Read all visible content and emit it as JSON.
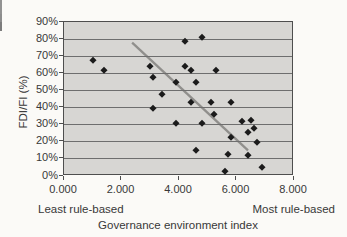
{
  "chart_data": {
    "type": "scatter",
    "title": "",
    "xlabel": "Governance environment index",
    "ylabel": "FDI/FI (%)",
    "x_axis": {
      "min": 0,
      "max": 8,
      "tick_labels": [
        "0.000",
        "2.000",
        "4.000",
        "6.000",
        "8.000"
      ],
      "grid": false
    },
    "y_axis": {
      "min": 0,
      "max": 90,
      "tick_labels": [
        "90%",
        "80%",
        "70%",
        "60%",
        "50%",
        "40%",
        "30%",
        "20%",
        "10%",
        "0%"
      ],
      "grid": true
    },
    "annotations": {
      "left": "Least rule-based",
      "right": "Most rule-based"
    },
    "legend": "none",
    "points": [
      [
        1.0,
        68
      ],
      [
        1.4,
        62
      ],
      [
        3.0,
        64
      ],
      [
        3.1,
        58
      ],
      [
        3.1,
        40
      ],
      [
        3.4,
        48
      ],
      [
        3.9,
        55
      ],
      [
        3.9,
        31
      ],
      [
        4.2,
        79
      ],
      [
        4.2,
        64
      ],
      [
        4.4,
        62
      ],
      [
        4.4,
        43
      ],
      [
        4.6,
        55
      ],
      [
        4.6,
        15
      ],
      [
        4.8,
        81
      ],
      [
        4.8,
        31
      ],
      [
        5.1,
        43
      ],
      [
        5.2,
        36
      ],
      [
        5.3,
        62
      ],
      [
        5.6,
        3
      ],
      [
        5.7,
        13
      ],
      [
        5.8,
        43
      ],
      [
        5.8,
        23
      ],
      [
        6.2,
        32
      ],
      [
        6.4,
        26
      ],
      [
        6.4,
        12
      ],
      [
        6.5,
        33
      ],
      [
        6.6,
        28
      ],
      [
        6.7,
        20
      ],
      [
        6.9,
        5
      ]
    ],
    "trendline": {
      "x1": 2.37,
      "y1": 78,
      "x2": 6.4,
      "y2": 15
    },
    "colors": {
      "plot_bg": "#d7d6d3",
      "marker": "#1b1b1b",
      "gridline": "#6e6e6e",
      "border": "#4e4e4e",
      "trend": "#908f8c",
      "text": "#383838"
    }
  }
}
